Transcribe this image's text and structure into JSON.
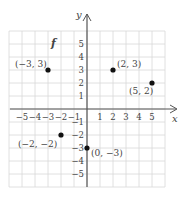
{
  "chart_data": {
    "type": "scatter",
    "title": "",
    "function_label": "f",
    "xlabel": "x",
    "ylabel": "y",
    "xlim": [
      -6,
      6
    ],
    "ylim": [
      -6,
      6
    ],
    "grid": true,
    "x_ticks": [
      -5,
      -4,
      -3,
      -2,
      -1,
      1,
      2,
      3,
      4,
      5
    ],
    "y_ticks": [
      -5,
      -4,
      -3,
      -2,
      -1,
      1,
      2,
      3,
      4,
      5
    ],
    "x_tick_labels": [
      "−5",
      "−4",
      "−3",
      "−2",
      "−1",
      "1",
      "2",
      "3",
      "4",
      "5"
    ],
    "y_tick_labels": [
      "−5",
      "−4",
      "−3",
      "−2",
      "−1",
      "1",
      "2",
      "3",
      "4",
      "5"
    ],
    "points": [
      {
        "x": -3,
        "y": 3,
        "label": "(−3, 3)"
      },
      {
        "x": 2,
        "y": 3,
        "label": "(2, 3)"
      },
      {
        "x": 5,
        "y": 2,
        "label": "(5, 2)"
      },
      {
        "x": -2,
        "y": -2,
        "label": "(−2, −2)"
      },
      {
        "x": 0,
        "y": -3,
        "label": "(0, −3)"
      }
    ],
    "colors": {
      "grid": "#d8d8d8",
      "axis": "#555555",
      "point": "#111111",
      "text": "#444444"
    }
  }
}
